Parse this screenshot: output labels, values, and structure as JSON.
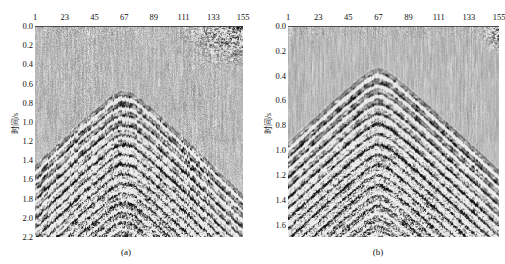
{
  "figure": {
    "type": "seismic-section-comparison",
    "background_color": "#ffffff",
    "plot_background_color": "#c9c9c9"
  },
  "panels": [
    {
      "id": "a",
      "caption": "(a)",
      "ylabel": "时间/s",
      "xlabel": "",
      "xticks": [
        "1",
        "23",
        "45",
        "67",
        "89",
        "111",
        "133",
        "155"
      ],
      "xtick_values": [
        1,
        23,
        45,
        67,
        89,
        111,
        133,
        155
      ],
      "yticks": [
        "0.0",
        "0.2",
        "0.4",
        "0.6",
        "0.8",
        "1.0",
        "1.2",
        "1.4",
        "1.6",
        "1.8",
        "2.0",
        "2.2"
      ],
      "ytick_values": [
        0.0,
        0.2,
        0.4,
        0.6,
        0.8,
        1.0,
        1.2,
        1.4,
        1.6,
        1.8,
        2.0,
        2.2
      ],
      "xlim": [
        1,
        155
      ],
      "ylim": [
        0.0,
        2.2
      ],
      "noise_level": "high",
      "noise_patch": "upper-right",
      "apex_trace": 67,
      "apex_time": 0.68
    },
    {
      "id": "b",
      "caption": "(b)",
      "ylabel": "时间/s",
      "xlabel": "",
      "xticks": [
        "1",
        "23",
        "45",
        "67",
        "89",
        "111",
        "133",
        "155"
      ],
      "xtick_values": [
        1,
        23,
        45,
        67,
        89,
        111,
        133,
        155
      ],
      "yticks": [
        "0.0",
        "0.2",
        "0.4",
        "0.6",
        "0.8",
        "1.0",
        "1.2",
        "1.4",
        "1.6"
      ],
      "ytick_values": [
        0.0,
        0.2,
        0.4,
        0.6,
        0.8,
        1.0,
        1.2,
        1.4,
        1.6
      ],
      "xlim": [
        1,
        155
      ],
      "ylim": [
        0.0,
        1.7
      ],
      "noise_level": "low",
      "noise_patch": "upper-right-small",
      "apex_trace": 67,
      "apex_time": 0.34
    }
  ],
  "chart_data": {
    "type": "heatmap",
    "title": "",
    "subtitle": "",
    "xlabel": "",
    "ylabel": "时间/s",
    "grid": false,
    "legend": "none",
    "series": [
      {
        "name": "(a) noisy seismic section",
        "xlabel": "",
        "ylabel": "时间/s",
        "xlim": [
          1,
          155
        ],
        "ylim": [
          0.0,
          2.2
        ],
        "xticks": [
          1,
          23,
          45,
          67,
          89,
          111,
          133,
          155
        ],
        "yticks": [
          0.0,
          0.2,
          0.4,
          0.6,
          0.8,
          1.0,
          1.2,
          1.4,
          1.6,
          1.8,
          2.0,
          2.2
        ],
        "n_traces": 155,
        "reflector_apex": {
          "trace": 67,
          "time": 0.68
        },
        "reflector_flank_slope_left_s_per_trace": 0.0085,
        "reflector_flank_slope_right_s_per_trace": 0.008,
        "noise_patch_region": {
          "trace_start": 115,
          "trace_end": 155,
          "time_start": 0.0,
          "time_end": 0.42
        },
        "dominant_frequency_cycles_per_second": 26,
        "amplitude_range": [
          -1,
          1
        ]
      },
      {
        "name": "(b) denoised seismic section",
        "xlabel": "",
        "ylabel": "时间/s",
        "xlim": [
          1,
          155
        ],
        "ylim": [
          0.0,
          1.7
        ],
        "xticks": [
          1,
          23,
          45,
          67,
          89,
          111,
          133,
          155
        ],
        "yticks": [
          0.0,
          0.2,
          0.4,
          0.6,
          0.8,
          1.0,
          1.2,
          1.4,
          1.6
        ],
        "n_traces": 155,
        "reflector_apex": {
          "trace": 67,
          "time": 0.34
        },
        "reflector_flank_slope_left_s_per_trace": 0.009,
        "reflector_flank_slope_right_s_per_trace": 0.0085,
        "noise_patch_region": {
          "trace_start": 143,
          "trace_end": 155,
          "time_start": 0.0,
          "time_end": 0.18
        },
        "dominant_frequency_cycles_per_second": 26,
        "amplitude_range": [
          -1,
          1
        ]
      }
    ]
  }
}
